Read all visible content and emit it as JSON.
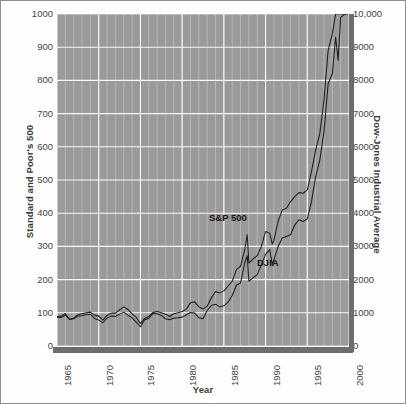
{
  "chart_data": {
    "type": "line",
    "title": "",
    "xlabel": "Year",
    "ylabel_left": "Standard and Poor's 500",
    "ylabel_right": "Dow-Jones Industrial Average",
    "grid": true,
    "legend_position": "inline-annotation",
    "xlim": [
      1965,
      2000
    ],
    "xticks": [
      "1965",
      "1970",
      "1975",
      "1980",
      "1985",
      "1990",
      "1995",
      "2000"
    ],
    "xtick_values": [
      1965,
      1970,
      1975,
      1980,
      1985,
      1990,
      1995,
      2000
    ],
    "ylim_left": [
      0,
      1000
    ],
    "yticks_left": [
      "0",
      "100",
      "200",
      "300",
      "400",
      "500",
      "600",
      "700",
      "800",
      "900",
      "1000"
    ],
    "ytick_values_left": [
      0,
      100,
      200,
      300,
      400,
      500,
      600,
      700,
      800,
      900,
      1000
    ],
    "ylim_right": [
      0,
      10000
    ],
    "yticks_right": [
      "0",
      "1000",
      "2000",
      "3000",
      "4000",
      "5000",
      "6000",
      "7000",
      "8000",
      "9000",
      "10,000"
    ],
    "ytick_values_right": [
      0,
      1000,
      2000,
      3000,
      4000,
      5000,
      6000,
      7000,
      8000,
      9000,
      10000
    ],
    "series": [
      {
        "name": "S&P 500",
        "label_text": "S&P 500",
        "axis": "left",
        "color": "#1c1c1c",
        "x": [
          1965.0,
          1965.5,
          1966.0,
          1966.5,
          1967.0,
          1967.5,
          1968.0,
          1968.5,
          1969.0,
          1969.5,
          1970.0,
          1970.5,
          1971.0,
          1971.5,
          1972.0,
          1972.5,
          1973.0,
          1973.5,
          1974.0,
          1974.5,
          1975.0,
          1975.5,
          1976.0,
          1976.5,
          1977.0,
          1977.5,
          1978.0,
          1978.5,
          1979.0,
          1979.5,
          1980.0,
          1980.5,
          1981.0,
          1981.5,
          1982.0,
          1982.5,
          1983.0,
          1983.5,
          1984.0,
          1984.5,
          1985.0,
          1985.5,
          1986.0,
          1986.5,
          1987.0,
          1987.5,
          1987.8,
          1988.0,
          1988.5,
          1989.0,
          1989.5,
          1990.0,
          1990.5,
          1990.8,
          1991.0,
          1991.5,
          1992.0,
          1992.5,
          1993.0,
          1993.5,
          1994.0,
          1994.5,
          1995.0,
          1995.5,
          1996.0,
          1996.5,
          1997.0,
          1997.5,
          1998.0,
          1998.4,
          1998.7,
          1999.0,
          1999.5,
          1999.8
        ],
        "values": [
          87,
          86,
          93,
          80,
          84,
          94,
          97,
          100,
          102,
          93,
          90,
          78,
          92,
          99,
          99,
          109,
          118,
          110,
          97,
          86,
          68,
          83,
          89,
          101,
          104,
          100,
          96,
          89,
          97,
          100,
          104,
          111,
          130,
          133,
          118,
          111,
          120,
          145,
          164,
          160,
          166,
          180,
          195,
          230,
          240,
          290,
          335,
          250,
          262,
          272,
          300,
          345,
          340,
          307,
          318,
          375,
          410,
          415,
          435,
          450,
          462,
          460,
          470,
          525,
          590,
          640,
          740,
          890,
          940,
          1080,
          1020,
          1180,
          1270,
          1320
        ],
        "peak_left_axis": 930
      },
      {
        "name": "DJIA",
        "label_text": "DJIA",
        "axis": "right",
        "color": "#1c1c1c",
        "x": [
          1965.0,
          1965.5,
          1966.0,
          1966.5,
          1967.0,
          1967.5,
          1968.0,
          1968.5,
          1969.0,
          1969.5,
          1970.0,
          1970.5,
          1971.0,
          1971.5,
          1972.0,
          1972.5,
          1973.0,
          1973.5,
          1974.0,
          1974.5,
          1975.0,
          1975.5,
          1976.0,
          1976.5,
          1977.0,
          1977.5,
          1978.0,
          1978.5,
          1979.0,
          1979.5,
          1980.0,
          1980.5,
          1981.0,
          1981.5,
          1982.0,
          1982.5,
          1983.0,
          1983.5,
          1984.0,
          1984.5,
          1985.0,
          1985.5,
          1986.0,
          1986.5,
          1987.0,
          1987.5,
          1987.8,
          1988.0,
          1988.5,
          1989.0,
          1989.5,
          1990.0,
          1990.5,
          1990.8,
          1991.0,
          1991.5,
          1992.0,
          1992.5,
          1993.0,
          1993.5,
          1994.0,
          1994.5,
          1995.0,
          1995.5,
          1996.0,
          1996.5,
          1997.0,
          1997.5,
          1998.0,
          1998.4,
          1998.7,
          1999.0,
          1999.5,
          1999.8
        ],
        "values": [
          880,
          900,
          980,
          800,
          820,
          900,
          910,
          950,
          950,
          830,
          780,
          700,
          840,
          900,
          890,
          960,
          1020,
          930,
          850,
          720,
          580,
          790,
          830,
          980,
          970,
          920,
          820,
          790,
          840,
          850,
          870,
          940,
          1010,
          990,
          850,
          820,
          1070,
          1220,
          1260,
          1180,
          1210,
          1320,
          1520,
          1830,
          1900,
          2500,
          2720,
          1950,
          2050,
          2150,
          2450,
          2760,
          2900,
          2450,
          2600,
          3000,
          3250,
          3300,
          3350,
          3650,
          3800,
          3750,
          3830,
          4350,
          5100,
          5600,
          6450,
          7900,
          8200,
          9300,
          8600,
          9900,
          10800,
          11200
        ],
        "peak_right_axis": 9300
      }
    ]
  },
  "figure": {
    "background_color": "#ffffff",
    "plot_background_color": "#9a9a9a",
    "grid_color": "#ffffff",
    "axis_bar_color": "#6d6d6d",
    "border_color": "#8e8e8e",
    "line_color": "#1c1c1c"
  }
}
